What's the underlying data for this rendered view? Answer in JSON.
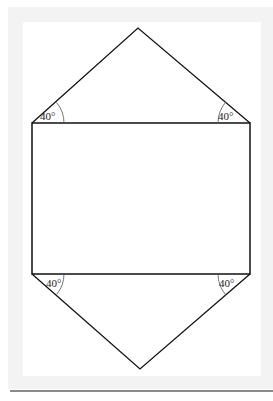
{
  "figure": {
    "type": "geometric-net",
    "colors": {
      "stroke": "#111111",
      "background": "#ffffff",
      "frame": "#f3f3f3",
      "rule": "#8a8a8a"
    },
    "points": {
      "top_apex": [
        138,
        28
      ],
      "rect_top_left": [
        32,
        123
      ],
      "rect_top_right": [
        250,
        123
      ],
      "rect_bottom_left": [
        32,
        274
      ],
      "rect_bottom_right": [
        250,
        274
      ],
      "bottom_apex": [
        140,
        369
      ]
    },
    "angles": [
      {
        "label": "40°",
        "position": "top-left"
      },
      {
        "label": "40°",
        "position": "top-right"
      },
      {
        "label": "40°",
        "position": "bottom-left"
      },
      {
        "label": "40°",
        "position": "bottom-right"
      }
    ]
  }
}
